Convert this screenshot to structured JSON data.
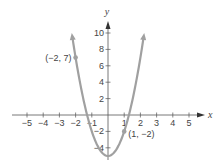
{
  "chart_data": {
    "type": "line",
    "title": "",
    "xlabel": "x",
    "ylabel": "y",
    "function": "y = 3x^2 - 5",
    "xlim": [
      -5.5,
      5.5
    ],
    "ylim": [
      -5.5,
      11
    ],
    "x_ticks": [
      -5,
      -4,
      -3,
      -2,
      -1,
      1,
      2,
      3,
      4,
      5
    ],
    "x_tick_labels": [
      "−5",
      "−4",
      "−3",
      "−2",
      "−1",
      "1",
      "2",
      "3",
      "4",
      "5"
    ],
    "y_ticks": [
      10,
      8,
      6,
      4,
      2,
      -2,
      -4
    ],
    "y_tick_labels": [
      "10",
      "8",
      "6",
      "4",
      "2",
      "−2",
      "−4"
    ],
    "grid": false,
    "series": [
      {
        "name": "parabola",
        "color": "#a0a0a0",
        "x": [
          -2.2,
          -2,
          -1.5,
          -1,
          -0.5,
          0,
          0.5,
          1,
          1.5,
          2,
          2.2
        ],
        "y": [
          9.52,
          7,
          1.75,
          -2,
          -4.25,
          -5,
          -4.25,
          -2,
          1.75,
          7,
          9.52
        ]
      }
    ],
    "annotations": [
      {
        "x": -2,
        "y": 7,
        "label": "(−2, 7)"
      },
      {
        "x": 1,
        "y": -2,
        "label": "(1, −2)"
      }
    ]
  }
}
